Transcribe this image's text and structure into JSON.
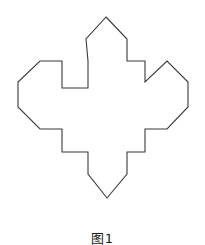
{
  "page": {
    "background_color": "#ffffff",
    "width": 205,
    "height": 245
  },
  "figure": {
    "name": "four-pointed-pentagonal-cross",
    "stroke_color": "#3a3a3a",
    "fill_color": "#ffffff",
    "stroke_width": 1,
    "path": "M 106 17 L 127 39 L 127 61 L 145 61 L 145 82 L 167 61 L 188 82 L 188 107 L 167 129 L 145 129 L 145 152 L 127 152 L 127 174 L 107 198 L 88 174 L 88 152 L 62 152 L 62 129 L 40 129 L 18 107 L 18 82 L 40 61 L 62 61 L 62 88 L 88 88 L 88 61 L 86 39 Z",
    "vertices": [
      [
        106,
        17
      ],
      [
        127,
        39
      ],
      [
        127,
        61
      ],
      [
        145,
        61
      ],
      [
        145,
        82
      ],
      [
        167,
        61
      ],
      [
        188,
        82
      ],
      [
        188,
        107
      ],
      [
        167,
        129
      ],
      [
        145,
        129
      ],
      [
        145,
        152
      ],
      [
        127,
        152
      ],
      [
        127,
        174
      ],
      [
        107,
        198
      ],
      [
        88,
        174
      ],
      [
        88,
        152
      ],
      [
        62,
        152
      ],
      [
        62,
        129
      ],
      [
        40,
        129
      ],
      [
        18,
        107
      ],
      [
        18,
        82
      ],
      [
        40,
        61
      ],
      [
        62,
        61
      ],
      [
        62,
        88
      ],
      [
        88,
        88
      ],
      [
        88,
        61
      ],
      [
        86,
        39
      ]
    ],
    "caption": "图1"
  }
}
